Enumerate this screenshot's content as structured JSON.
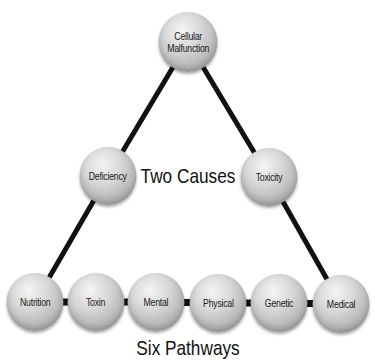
{
  "diagram": {
    "top": {
      "label": "Cellular\nMalfunction",
      "cx": 188,
      "cy": 42,
      "r": 30
    },
    "causes": [
      {
        "label": "Deficiency",
        "cx": 108,
        "cy": 176,
        "r": 29
      },
      {
        "label": "Toxicity",
        "cx": 269,
        "cy": 177,
        "r": 29
      }
    ],
    "pathways": [
      {
        "label": "Nutrition",
        "cx": 35,
        "cy": 302,
        "r": 29
      },
      {
        "label": "Toxin",
        "cx": 96,
        "cy": 302,
        "r": 29
      },
      {
        "label": "Mental",
        "cx": 156,
        "cy": 302,
        "r": 29
      },
      {
        "label": "Physical",
        "cx": 218,
        "cy": 303,
        "r": 29
      },
      {
        "label": "Genetic",
        "cx": 279,
        "cy": 303,
        "r": 29
      },
      {
        "label": "Medical",
        "cx": 341,
        "cy": 304,
        "r": 29
      }
    ],
    "captions": {
      "causes": "Two Causes",
      "pathways": "Six Pathways"
    },
    "colors": {
      "line": "#111111",
      "sphere_light": "#f4f4f4",
      "sphere_dark": "#8e8e8e",
      "text": "#1a1a1a"
    }
  }
}
